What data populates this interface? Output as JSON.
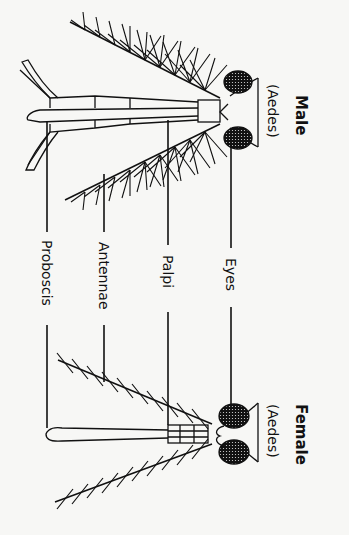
{
  "diagram": {
    "type": "labeled anatomical comparison (rotated 90°)",
    "male": {
      "title": "Male",
      "subtitle": "(Aedes)"
    },
    "female": {
      "title": "Female",
      "subtitle": "(Aedes)"
    },
    "labels": [
      {
        "id": "eyes",
        "text": "Eyes"
      },
      {
        "id": "palpi",
        "text": "Palpi"
      },
      {
        "id": "antennae",
        "text": "Antennae"
      },
      {
        "id": "proboscis",
        "text": "Proboscis"
      }
    ],
    "colors": {
      "ink": "#111111",
      "background": "#f7f7f5"
    }
  }
}
